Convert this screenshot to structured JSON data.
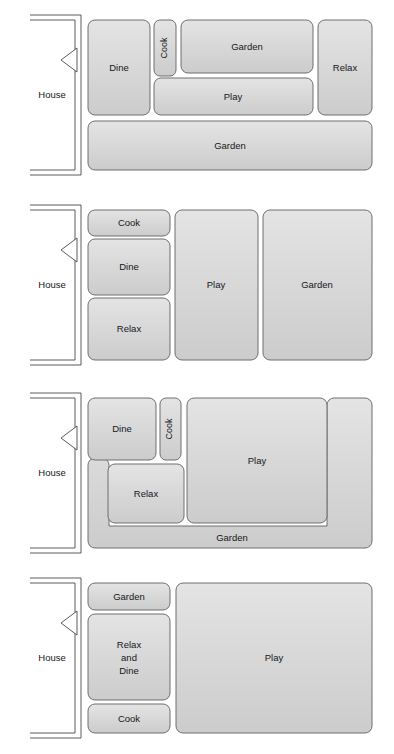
{
  "page": {
    "background_color": "#ffffff",
    "zone_fill_top": "#e2e2e2",
    "zone_fill_bottom": "#cfcfcf",
    "zone_border_color": "#6e6e6e",
    "wall_color": "#4a4a4a",
    "text_color": "#16161a"
  },
  "diagrams": [
    {
      "id": "diagram-1",
      "name": "layout-option-1",
      "house": {
        "label": "House",
        "door_icon": "door-swing-icon"
      },
      "zones": [
        {
          "name": "dine",
          "label": "Dine",
          "orientation": "horizontal",
          "x": 88,
          "y": 20,
          "w": 62,
          "h": 95
        },
        {
          "name": "cook",
          "label": "Cook",
          "orientation": "vertical",
          "x": 154,
          "y": 20,
          "w": 22,
          "h": 56
        },
        {
          "name": "garden-top",
          "label": "Garden",
          "orientation": "horizontal",
          "x": 181,
          "y": 20,
          "w": 132,
          "h": 53
        },
        {
          "name": "play",
          "label": "Play",
          "orientation": "horizontal",
          "x": 154,
          "y": 78,
          "w": 159,
          "h": 37
        },
        {
          "name": "relax",
          "label": "Relax",
          "orientation": "horizontal",
          "x": 318,
          "y": 20,
          "w": 54,
          "h": 95
        },
        {
          "name": "garden-bottom",
          "label": "Garden",
          "orientation": "horizontal",
          "x": 88,
          "y": 121,
          "w": 284,
          "h": 49
        }
      ]
    },
    {
      "id": "diagram-2",
      "name": "layout-option-2",
      "house": {
        "label": "House",
        "door_icon": "door-swing-icon"
      },
      "zones": [
        {
          "name": "cook",
          "label": "Cook",
          "orientation": "horizontal",
          "x": 88,
          "y": 20,
          "w": 82,
          "h": 26
        },
        {
          "name": "dine",
          "label": "Dine",
          "orientation": "horizontal",
          "x": 88,
          "y": 49,
          "w": 82,
          "h": 56
        },
        {
          "name": "relax",
          "label": "Relax",
          "orientation": "horizontal",
          "x": 88,
          "y": 108,
          "w": 82,
          "h": 62
        },
        {
          "name": "play",
          "label": "Play",
          "orientation": "horizontal",
          "x": 175,
          "y": 20,
          "w": 83,
          "h": 150
        },
        {
          "name": "garden",
          "label": "Garden",
          "orientation": "horizontal",
          "x": 263,
          "y": 20,
          "w": 109,
          "h": 150
        }
      ]
    },
    {
      "id": "diagram-3",
      "name": "layout-option-3",
      "house": {
        "label": "House",
        "door_icon": "door-swing-icon"
      },
      "garden_wrap": {
        "name": "garden",
        "label": "Garden",
        "shape": "u-shaped-wrap",
        "outer_x": 88,
        "outer_y": 20,
        "outer_w": 284,
        "outer_h": 150,
        "arm_width": 22,
        "label_x": 232,
        "label_y": 160
      },
      "zones": [
        {
          "name": "dine",
          "label": "Dine",
          "orientation": "horizontal",
          "x": 88,
          "y": 20,
          "w": 68,
          "h": 62
        },
        {
          "name": "cook",
          "label": "Cook",
          "orientation": "vertical",
          "x": 160,
          "y": 20,
          "w": 21,
          "h": 62
        },
        {
          "name": "relax",
          "label": "Relax",
          "orientation": "horizontal",
          "x": 108,
          "y": 86,
          "w": 76,
          "h": 59
        },
        {
          "name": "play",
          "label": "Play",
          "orientation": "horizontal",
          "x": 187,
          "y": 20,
          "w": 140,
          "h": 125
        }
      ]
    },
    {
      "id": "diagram-4",
      "name": "layout-option-4",
      "house": {
        "label": "House",
        "door_icon": "door-swing-icon"
      },
      "zones": [
        {
          "name": "garden",
          "label": "Garden",
          "orientation": "horizontal",
          "x": 88,
          "y": 20,
          "w": 82,
          "h": 27
        },
        {
          "name": "relax-and-dine",
          "label": "Relax\nand\nDine",
          "orientation": "horizontal",
          "x": 88,
          "y": 51,
          "w": 82,
          "h": 86
        },
        {
          "name": "cook",
          "label": "Cook",
          "orientation": "horizontal",
          "x": 88,
          "y": 141,
          "w": 82,
          "h": 29
        },
        {
          "name": "play",
          "label": "Play",
          "orientation": "horizontal",
          "x": 176,
          "y": 20,
          "w": 196,
          "h": 150
        }
      ]
    }
  ],
  "house_geometry": {
    "inner_left": 30,
    "inner_right": 75,
    "outer_right": 81,
    "top": 20,
    "bottom": 170,
    "gap": 5,
    "label_x": 52,
    "label_y": 95,
    "door_top": 48,
    "door_bottom": 72,
    "door_tip_x": 61
  }
}
